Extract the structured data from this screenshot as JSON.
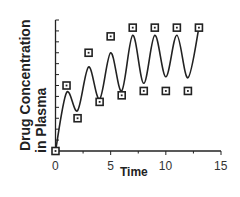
{
  "chart_data": {
    "type": "line",
    "title": "",
    "xlabel": "Time",
    "ylabel_line1": "Drug  Concentration",
    "ylabel_line2": "in  Plasma",
    "xlim": [
      0,
      15
    ],
    "ylim": [
      0,
      12
    ],
    "x_ticks": [
      0,
      5,
      10,
      15
    ],
    "x_tick_labels": [
      "0",
      "5",
      "10",
      "15"
    ],
    "x_minor_step": 2.5,
    "y_tick_count": 13,
    "y_tick_labels": [],
    "grid": false,
    "legend": null,
    "series": [
      {
        "name": "model curve",
        "kind": "line",
        "color": "#222222",
        "x": [
          0,
          1,
          2,
          3,
          4,
          5,
          6,
          7,
          8,
          9,
          10,
          11,
          12,
          13
        ],
        "y": [
          0,
          5.35,
          3.7,
          7.7,
          4.75,
          9.0,
          5.5,
          10.6,
          6.2,
          10.6,
          6.8,
          10.6,
          6.7,
          11.3
        ]
      },
      {
        "name": "observed",
        "kind": "scatter",
        "marker": "square",
        "color": "#222222",
        "x": [
          0,
          1,
          2,
          3,
          4,
          5,
          6,
          7,
          8,
          9,
          10,
          11,
          12,
          13
        ],
        "y": [
          0,
          6.0,
          3.0,
          9.0,
          4.5,
          10.5,
          5.1,
          11.3,
          5.5,
          11.3,
          5.5,
          11.3,
          5.5,
          11.3
        ]
      }
    ]
  }
}
